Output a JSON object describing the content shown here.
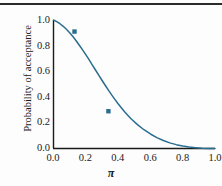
{
  "chart_data": {
    "type": "line",
    "title": "",
    "subtitle": "",
    "xlabel": "π",
    "ylabel": "Probability of acceptance",
    "xlim": [
      0.0,
      1.0
    ],
    "ylim": [
      0.0,
      1.0
    ],
    "xticks": [
      "0.0",
      "0.2",
      "0.4",
      "0.6",
      "0.8",
      "1.0"
    ],
    "yticks": [
      "0.0",
      "0.2",
      "0.4",
      "0.6",
      "0.8",
      "1.0"
    ],
    "xtick_values": [
      0.0,
      0.2,
      0.4,
      0.6,
      0.8,
      1.0
    ],
    "ytick_values": [
      0.0,
      0.2,
      0.4,
      0.6,
      0.8,
      1.0
    ],
    "grid": false,
    "legend": null,
    "legend_position": "none",
    "line_color": "#2b6d8f",
    "marker_color": "#2b6d8f",
    "series": [
      {
        "name": "Operating characteristic curve",
        "x": [
          0.0,
          0.02,
          0.04,
          0.06,
          0.08,
          0.1,
          0.12,
          0.14,
          0.16,
          0.18,
          0.2,
          0.22,
          0.24,
          0.26,
          0.28,
          0.3,
          0.32,
          0.34,
          0.36,
          0.38,
          0.4,
          0.44,
          0.48,
          0.52,
          0.56,
          0.6,
          0.64,
          0.68,
          0.72,
          0.76,
          0.8,
          0.84,
          0.88,
          0.92,
          0.96,
          1.0
        ],
        "y": [
          1.0,
          0.987,
          0.971,
          0.951,
          0.928,
          0.901,
          0.871,
          0.839,
          0.804,
          0.768,
          0.73,
          0.691,
          0.651,
          0.611,
          0.571,
          0.531,
          0.492,
          0.454,
          0.417,
          0.382,
          0.348,
          0.286,
          0.232,
          0.186,
          0.146,
          0.113,
          0.085,
          0.062,
          0.044,
          0.03,
          0.019,
          0.011,
          0.006,
          0.002,
          0.0,
          0.0
        ]
      }
    ],
    "markers": [
      {
        "x": 0.13,
        "y": 0.91,
        "shape": "square"
      },
      {
        "x": 0.34,
        "y": 0.29,
        "shape": "square"
      }
    ]
  }
}
